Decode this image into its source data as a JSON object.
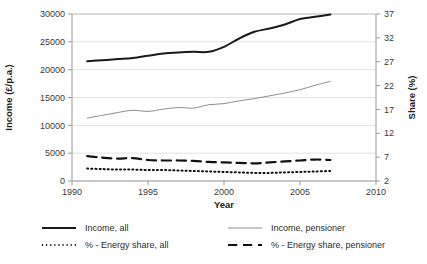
{
  "chart_data": {
    "type": "line",
    "title": "",
    "xlabel": "Year",
    "ylabel": "Income (£/p.a.)",
    "y2label": "Share (%)",
    "grid": true,
    "legend_position": "bottom",
    "xlim": [
      1990,
      2010
    ],
    "xticks": [
      1990,
      1995,
      2000,
      2005,
      2010
    ],
    "ylim": [
      0,
      30000
    ],
    "yticks": [
      0,
      5000,
      10000,
      15000,
      20000,
      25000,
      30000
    ],
    "y2lim": [
      2,
      37
    ],
    "y2ticks": [
      2,
      7,
      12,
      17,
      22,
      27,
      32,
      37
    ],
    "x": [
      1991,
      1992,
      1993,
      1994,
      1995,
      1996,
      1997,
      1998,
      1999,
      2000,
      2001,
      2002,
      2003,
      2004,
      2005,
      2006,
      2007
    ],
    "series": [
      {
        "name": "Income, all",
        "axis": "left",
        "color": "#1a1a1a",
        "style": "solid",
        "width": 2.0,
        "values": [
          21500,
          21700,
          21900,
          22100,
          22500,
          22900,
          23100,
          23200,
          23200,
          24100,
          25600,
          26800,
          27400,
          28100,
          29100,
          29500,
          29900
        ]
      },
      {
        "name": "Income, pensioner",
        "axis": "left",
        "color": "#8c8c8c",
        "style": "solid",
        "width": 1.0,
        "values": [
          11300,
          11800,
          12300,
          12700,
          12500,
          12900,
          13200,
          13100,
          13700,
          13900,
          14400,
          14800,
          15300,
          15800,
          16400,
          17200,
          17900
        ]
      },
      {
        "name": "% - Energy share, all",
        "axis": "right",
        "color": "#111111",
        "style": "dotted",
        "width": 2.0,
        "values": [
          4.6,
          4.5,
          4.4,
          4.4,
          4.3,
          4.3,
          4.2,
          4.1,
          4.0,
          3.9,
          3.8,
          3.7,
          3.7,
          3.8,
          3.9,
          4.0,
          4.1
        ]
      },
      {
        "name": "% - Energy share, pensioner",
        "axis": "right",
        "color": "#111111",
        "style": "dashed",
        "width": 2.2,
        "values": [
          7.2,
          6.9,
          6.7,
          6.8,
          6.4,
          6.3,
          6.3,
          6.2,
          6.0,
          5.9,
          5.8,
          5.7,
          5.9,
          6.1,
          6.3,
          6.5,
          6.4
        ]
      }
    ]
  },
  "legend": {
    "items": [
      {
        "label": "Income, all",
        "style": "solid",
        "color": "#1a1a1a",
        "width": 2.0
      },
      {
        "label": "Income, pensioner",
        "style": "solid",
        "color": "#8c8c8c",
        "width": 1.0
      },
      {
        "label": "% - Energy share, all",
        "style": "dotted",
        "color": "#111111",
        "width": 2.0
      },
      {
        "label": "% - Energy share, pensioner",
        "style": "dashed",
        "color": "#111111",
        "width": 2.2
      }
    ]
  }
}
